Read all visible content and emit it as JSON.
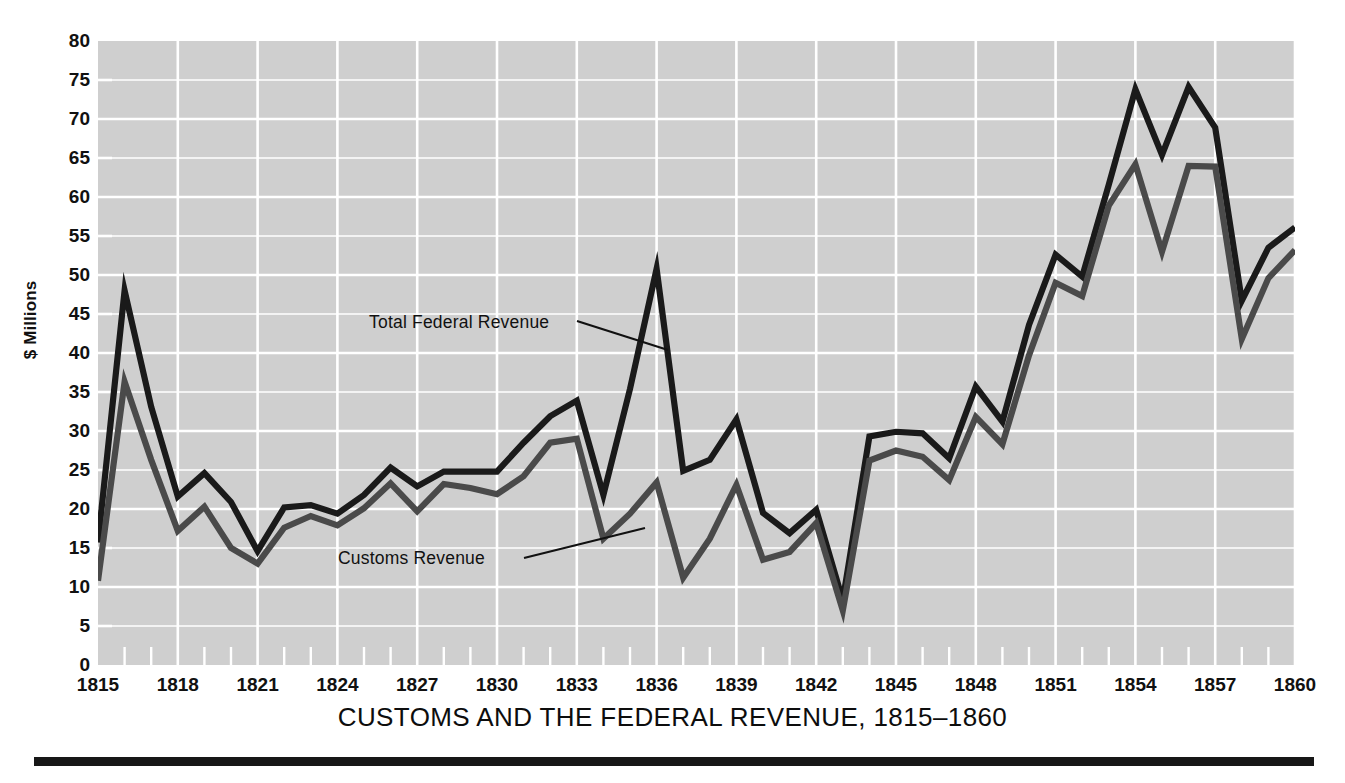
{
  "chart_data": {
    "type": "line",
    "title": "CUSTOMS AND THE FEDERAL REVENUE, 1815–1860",
    "xlabel": "",
    "ylabel": "$ Millions",
    "xlim": [
      1815,
      1860
    ],
    "ylim": [
      0,
      80
    ],
    "grid": true,
    "legend_position": "inline-annotations",
    "y_ticks": [
      0,
      5,
      10,
      15,
      20,
      25,
      30,
      35,
      40,
      45,
      50,
      55,
      60,
      65,
      70,
      75,
      80
    ],
    "x_ticks": [
      1815,
      1818,
      1821,
      1824,
      1827,
      1830,
      1833,
      1836,
      1839,
      1842,
      1845,
      1848,
      1851,
      1854,
      1857,
      1860
    ],
    "x_minor_tick_step": 1,
    "x": [
      1815,
      1816,
      1817,
      1818,
      1819,
      1820,
      1821,
      1822,
      1823,
      1824,
      1825,
      1826,
      1827,
      1828,
      1829,
      1830,
      1831,
      1832,
      1833,
      1834,
      1835,
      1836,
      1837,
      1838,
      1839,
      1840,
      1841,
      1842,
      1843,
      1844,
      1845,
      1846,
      1847,
      1848,
      1849,
      1850,
      1851,
      1852,
      1853,
      1854,
      1855,
      1856,
      1857,
      1858,
      1859,
      1860
    ],
    "series": [
      {
        "name": "Total Federal Revenue",
        "color": "#1a1a1a",
        "values": [
          15.7,
          48.0,
          33.1,
          21.6,
          24.6,
          20.9,
          14.6,
          20.2,
          20.5,
          19.4,
          21.8,
          25.3,
          22.9,
          24.8,
          24.8,
          24.8,
          28.5,
          31.9,
          33.9,
          21.8,
          35.4,
          50.8,
          24.9,
          26.3,
          31.5,
          19.5,
          16.9,
          19.9,
          8.3,
          29.3,
          29.9,
          29.7,
          26.5,
          35.7,
          31.2,
          43.6,
          52.6,
          49.8,
          61.6,
          73.8,
          65.4,
          74.1,
          68.9,
          46.7,
          53.5,
          56.1
        ]
      },
      {
        "name": "Customs Revenue",
        "color": "#4a4a4a",
        "values": [
          10.8,
          36.3,
          26.3,
          17.2,
          20.3,
          15.0,
          13.0,
          17.6,
          19.1,
          17.9,
          20.1,
          23.3,
          19.7,
          23.2,
          22.7,
          21.9,
          24.2,
          28.5,
          29.0,
          16.2,
          19.4,
          23.4,
          11.2,
          16.2,
          23.1,
          13.5,
          14.5,
          18.2,
          7.0,
          26.2,
          27.5,
          26.7,
          23.7,
          31.8,
          28.3,
          39.7,
          49.0,
          47.3,
          58.9,
          64.2,
          53.0,
          64.0,
          63.9,
          41.8,
          49.6,
          53.2
        ]
      }
    ],
    "annotations": [
      {
        "text": "Total Federal Revenue",
        "x": 1825,
        "y": 43.5
      },
      {
        "text": "Customs Revenue",
        "x": 1824,
        "y": 15.5
      }
    ]
  },
  "style": {
    "plot_background": "#cfcfcf",
    "gridline_color": "#ffffff",
    "page_background": "#ffffff",
    "rule_color": "#171717"
  }
}
